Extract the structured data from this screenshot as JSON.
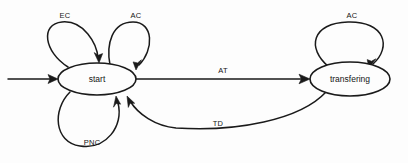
{
  "diagram": {
    "type": "state-machine",
    "title": "",
    "background_color": "#fdfdfd",
    "stroke_color": "#1a1a1a",
    "nodes": [
      {
        "id": "start",
        "label": "start",
        "cx": 97,
        "cy": 79,
        "rx": 39,
        "ry": 16
      },
      {
        "id": "transferring",
        "label": "transfering",
        "cx": 350,
        "cy": 79,
        "rx": 40,
        "ry": 17
      }
    ],
    "initial_marker": {
      "label": "",
      "from_x": 8,
      "to_x": 57,
      "y": 79
    },
    "edges": [
      {
        "id": "ec-self",
        "label": "EC",
        "from": "start",
        "to": "start",
        "kind": "self-loop",
        "label_x": 65,
        "label_y": 16
      },
      {
        "id": "ac-self-start",
        "label": "AC",
        "from": "start",
        "to": "start",
        "kind": "self-loop",
        "label_x": 136,
        "label_y": 16
      },
      {
        "id": "pnc-self",
        "label": "PNC",
        "from": "start",
        "to": "start",
        "kind": "self-loop",
        "label_x": 92,
        "label_y": 143
      },
      {
        "id": "at",
        "label": "AT",
        "from": "start",
        "to": "transferring",
        "kind": "straight",
        "label_x": 223,
        "label_y": 71
      },
      {
        "id": "td",
        "label": "TD",
        "from": "transferring",
        "to": "start",
        "kind": "curve",
        "label_x": 218,
        "label_y": 124
      },
      {
        "id": "ac-self-transferring",
        "label": "AC",
        "from": "transferring",
        "to": "transferring",
        "kind": "self-loop",
        "label_x": 352,
        "label_y": 16
      }
    ]
  }
}
